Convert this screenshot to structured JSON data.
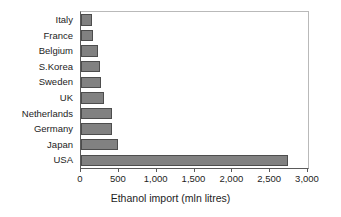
{
  "chart_data": {
    "type": "bar",
    "orientation": "horizontal",
    "title": "",
    "xlabel": "Ethanol import (mln litres)",
    "ylabel": "",
    "categories": [
      "Italy",
      "France",
      "Belgium",
      "S.Korea",
      "Sweden",
      "UK",
      "Netherlands",
      "Germany",
      "Japan",
      "USA"
    ],
    "values": [
      150,
      160,
      220,
      250,
      260,
      300,
      410,
      410,
      490,
      2740
    ],
    "xlim": [
      0,
      3000
    ],
    "xticks": [
      0,
      500,
      1000,
      1500,
      2000,
      2500,
      3000
    ],
    "xtick_labels": [
      "0",
      "500",
      "1,000",
      "1,500",
      "2,000",
      "2,500",
      "3,000"
    ],
    "grid": false,
    "legend": null,
    "bar_color": "#818181",
    "bar_edge_color": "#4d4d4d",
    "axis_color": "#5a5a5a",
    "frame_color": "#b9b9b9",
    "text_color": "#1d1d1d",
    "background": "#ffffff"
  }
}
